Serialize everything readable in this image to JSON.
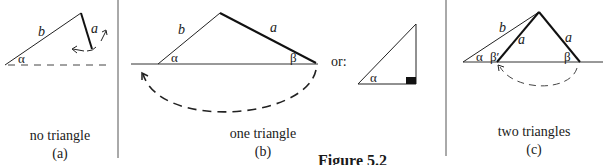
{
  "figure": {
    "title": "Figure 5.2",
    "panels": [
      {
        "id": "a",
        "caption": "no triangle",
        "letter": "(a)",
        "labels": {
          "side_b": "b",
          "side_a": "a",
          "angle_alpha": "α"
        }
      },
      {
        "id": "b",
        "caption": "one triangle",
        "letter": "(b)",
        "labels": {
          "side_b": "b",
          "side_a": "a",
          "angle_alpha": "α",
          "angle_beta": "β"
        },
        "alternative_label": "or:",
        "alternative_labels": {
          "angle_alpha": "α"
        }
      },
      {
        "id": "c",
        "caption": "two triangles",
        "letter": "(c)",
        "labels": {
          "side_b": "b",
          "side_a_left": "a",
          "side_a_right": "a",
          "angle_alpha": "α",
          "angle_beta_prime": "β′",
          "angle_beta": "β"
        }
      }
    ],
    "colors": {
      "ink": "#1a1a1a",
      "background": "#ffffff"
    }
  }
}
